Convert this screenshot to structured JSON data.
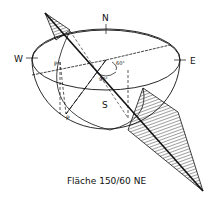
{
  "diagram": {
    "caption": "Fläche 150/60 NE",
    "labels": {
      "north": "N",
      "south": "S",
      "west": "W",
      "east": "E",
      "p_upper": "P'",
      "p_lower": "P",
      "angle_dip": "60°",
      "angle_right": "90°"
    },
    "colors": {
      "ink": "#111111",
      "background": "#ffffff"
    }
  }
}
